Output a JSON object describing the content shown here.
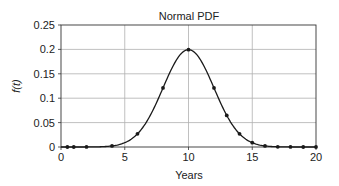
{
  "chart_data": {
    "type": "line",
    "title": "Normal PDF",
    "xlabel": "Years",
    "ylabel": "f(t)",
    "xlim": [
      0,
      20
    ],
    "ylim": [
      0,
      0.25
    ],
    "grid": true,
    "legend": null,
    "x_ticks": [
      0,
      5,
      10,
      15,
      20
    ],
    "x_tick_labels": [
      "0",
      "5",
      "10",
      "15",
      "20"
    ],
    "y_ticks": [
      0,
      0.05,
      0.1,
      0.15,
      0.2,
      0.25
    ],
    "y_tick_labels": [
      "0",
      "0.05",
      "0.1",
      "0.15",
      "0.2",
      "0.25"
    ],
    "series": [
      {
        "name": "Normal PDF (mean 10, sd 2)",
        "style": "smooth line with dot markers",
        "color": "#1a1a1a",
        "mean": 10,
        "sd": 2,
        "x": [
          0.5,
          1,
          2,
          4,
          6,
          8,
          10,
          12,
          13,
          14,
          15,
          16,
          17,
          18,
          19,
          20
        ],
        "y": [
          0.0,
          0.0,
          0.0001,
          0.0022,
          0.027,
          0.121,
          0.1995,
          0.121,
          0.0648,
          0.027,
          0.0088,
          0.0022,
          0.0004,
          0.0001,
          0.0,
          0.0
        ]
      }
    ]
  },
  "colors": {
    "axis": "#333333",
    "grid": "#b0b0b0",
    "line": "#1a1a1a",
    "marker": "#1a1a1a",
    "background": "#ffffff"
  }
}
